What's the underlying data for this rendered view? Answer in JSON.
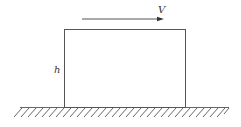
{
  "diagram": {
    "type": "physics-schematic",
    "labels": {
      "velocity": "V",
      "height": "h"
    },
    "colors": {
      "stroke": "#555555",
      "text": "#333333",
      "background": "#ffffff"
    },
    "elements": {
      "block": "rectangle resting on ground",
      "arrow": "velocity arrow pointing right above block",
      "ground": "hatched ground surface"
    }
  }
}
